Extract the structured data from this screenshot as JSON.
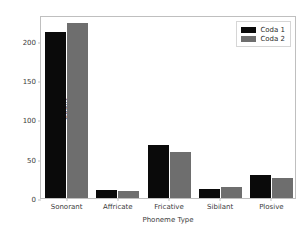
{
  "chart_data": {
    "type": "bar",
    "title": "",
    "xlabel": "Phoneme Type",
    "ylabel": "Count",
    "categories": [
      "Sonorant",
      "Affricate",
      "Fricative",
      "Sibilant",
      "Plosive"
    ],
    "series": [
      {
        "name": "Coda 1",
        "color": "#0a0a0a",
        "values": [
          212,
          10,
          68,
          11,
          29
        ]
      },
      {
        "name": "Coda 2",
        "color": "#6e6e6e",
        "values": [
          223,
          9,
          58,
          14,
          26
        ]
      }
    ],
    "ylim": [
      0,
      233
    ],
    "yticks": [
      0,
      50,
      100,
      150,
      200
    ],
    "ytick_labels": [
      "0",
      "50",
      "100",
      "150",
      "200"
    ],
    "grid": false,
    "legend_position": "upper right",
    "axis_color": "#bfbfbf",
    "text_color": "#3b3b3b",
    "background": "#ffffff"
  }
}
